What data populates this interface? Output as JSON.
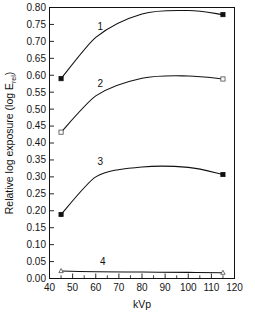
{
  "chart_data": {
    "type": "line",
    "title": "",
    "subtitle": "",
    "xlabel": "kVp",
    "ylabel": "Relative log exposure (log E",
    "ylabel_subscript": "rel",
    "ylabel_suffix": ")",
    "xlim": [
      40,
      120
    ],
    "ylim": [
      0.0,
      0.8
    ],
    "xticks": [
      40,
      50,
      60,
      70,
      80,
      90,
      100,
      110,
      120
    ],
    "xtick_labels": [
      "40",
      "50",
      "60",
      "70",
      "80",
      "90",
      "100",
      "110",
      "120"
    ],
    "x_minor_step": 5,
    "yticks": [
      0.0,
      0.05,
      0.1,
      0.15,
      0.2,
      0.25,
      0.3,
      0.35,
      0.4,
      0.45,
      0.5,
      0.55,
      0.6,
      0.65,
      0.7,
      0.75,
      0.8
    ],
    "ytick_labels": [
      "0.00",
      "0.05",
      "0.10",
      "0.15",
      "0.20",
      "0.25",
      "0.30",
      "0.35",
      "0.40",
      "0.45",
      "0.50",
      "0.55",
      "0.60",
      "0.65",
      "0.70",
      "0.75",
      "0.80"
    ],
    "grid": false,
    "legend_position": "inline-labels",
    "series": [
      {
        "name": "1",
        "marker": "filled-square",
        "label_x": 62,
        "label_y": 0.735,
        "x": [
          45,
          60,
          80,
          100,
          115
        ],
        "y": [
          0.59,
          0.712,
          0.781,
          0.791,
          0.779
        ],
        "marker_at": [
          45,
          115
        ]
      },
      {
        "name": "2",
        "marker": "open-square",
        "label_x": 62,
        "label_y": 0.565,
        "x": [
          45,
          60,
          80,
          100,
          115
        ],
        "y": [
          0.432,
          0.539,
          0.591,
          0.598,
          0.589
        ],
        "marker_at": [
          45,
          115
        ]
      },
      {
        "name": "3",
        "marker": "filled-square",
        "label_x": 62,
        "label_y": 0.335,
        "x": [
          45,
          60,
          80,
          100,
          115
        ],
        "y": [
          0.189,
          0.3,
          0.329,
          0.328,
          0.307
        ],
        "marker_at": [
          45,
          115
        ]
      },
      {
        "name": "4",
        "marker": "open-triangle",
        "label_x": 63,
        "label_y": 0.04,
        "x": [
          45,
          60,
          80,
          100,
          115
        ],
        "y": [
          0.022,
          0.02,
          0.019,
          0.018,
          0.017
        ],
        "marker_at": [
          45,
          115
        ]
      }
    ]
  },
  "colors": {
    "axis": "#111111",
    "line": "#111111",
    "marker_fill": "#111111",
    "marker_open_fill": "#ffffff",
    "background": "#ffffff"
  }
}
